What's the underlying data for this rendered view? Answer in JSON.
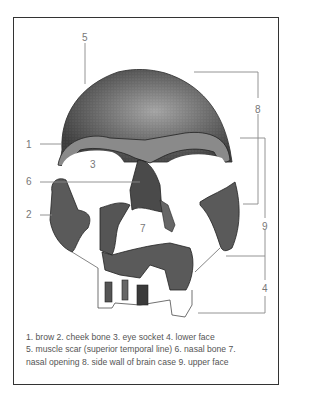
{
  "figure": {
    "labels": {
      "l1": "1",
      "l2": "2",
      "l3": "3",
      "l4": "4",
      "l5": "5",
      "l6": "6",
      "l7": "7",
      "l8": "8",
      "l9": "9"
    },
    "caption": {
      "line1": "1. brow 2. cheek bone 3. eye socket 4. lower face",
      "line2": "5. muscle scar (superior temporal line) 6. nasal bone 7.",
      "line3": "nasal opening 8. side wall of brain case 9. upper face"
    },
    "colors": {
      "bone_dark": "#3a3a3a",
      "bone_mid": "#6b6b6b",
      "bone_light": "#b5b5b5",
      "label_gray": "#777777",
      "frame": "#333333"
    }
  }
}
